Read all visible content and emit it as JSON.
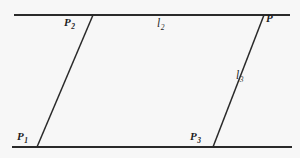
{
  "figure": {
    "background_color": "#f7f7f7",
    "line_color": "#2a2a2a",
    "label_color": "#1d1d1d"
  },
  "labels": {
    "p2": "P",
    "p2_sub": "2",
    "l2": "l",
    "l2_sub": "2",
    "p": "P",
    "l3": "l",
    "l3_sub": "3",
    "p1": "P",
    "p1_sub": "1",
    "p3": "P",
    "p3_sub": "3"
  },
  "geometry": {
    "top_line": {
      "name": "l2",
      "x1": 14,
      "y1": 15,
      "x2": 290,
      "y2": 15
    },
    "bottom_line": {
      "name": "bottom-parallel",
      "x1": 12,
      "y1": 147,
      "x2": 292,
      "y2": 147
    },
    "left_transversal": {
      "name": "P1-P2",
      "x1": 37,
      "y1": 147,
      "x2": 93,
      "y2": 15
    },
    "right_transversal": {
      "name": "l3",
      "x1": 213,
      "y1": 147,
      "x2": 264,
      "y2": 15
    },
    "points": {
      "P1": {
        "x": 37,
        "y": 147
      },
      "P2": {
        "x": 93,
        "y": 15
      },
      "P3": {
        "x": 213,
        "y": 147
      },
      "P": {
        "x": 264,
        "y": 15
      }
    }
  }
}
